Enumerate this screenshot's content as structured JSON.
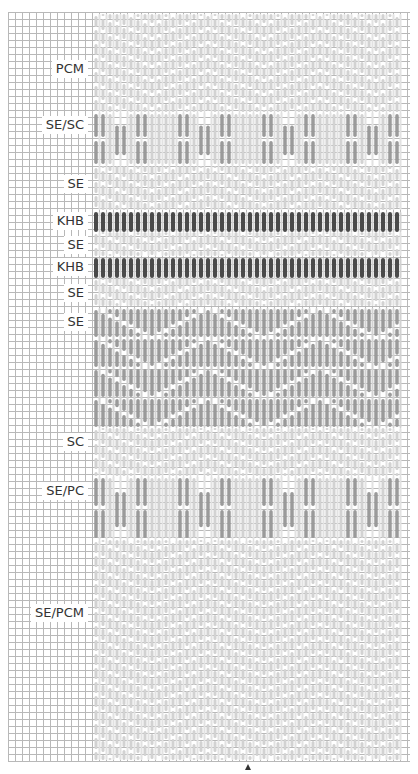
{
  "diagram": {
    "type": "bargello-stitch-chart",
    "grid": {
      "left": 8,
      "top": 12,
      "right": 410,
      "bottom": 762,
      "cell": 7,
      "color": "#b8b8b8"
    },
    "pattern_area": {
      "left": 94,
      "right": 402
    },
    "colors": {
      "light": "#d2d2d2",
      "medium": "#9a9a9a",
      "dark": "#4a4a4a",
      "gap": "#ffffff"
    },
    "sections": [
      {
        "label": "PCM",
        "label_y": 60,
        "y0": 14,
        "y1": 112,
        "style": "light-zigzag"
      },
      {
        "label": "SE/SC",
        "label_y": 116,
        "y0": 112,
        "y1": 166,
        "style": "medium-groups"
      },
      {
        "label": "SE",
        "label_y": 175,
        "y0": 166,
        "y1": 210,
        "style": "light-zigzag"
      },
      {
        "label": "KHB",
        "label_y": 212,
        "y0": 212,
        "y1": 232,
        "style": "dark-bars"
      },
      {
        "label": "SE",
        "label_y": 236,
        "y0": 232,
        "y1": 256,
        "style": "light-zigzag"
      },
      {
        "label": "KHB",
        "label_y": 258,
        "y0": 258,
        "y1": 278,
        "style": "dark-bars"
      },
      {
        "label": "SE",
        "label_y": 284,
        "y0": 278,
        "y1": 306,
        "style": "light-zigzag"
      },
      {
        "label": "SE",
        "label_y": 313,
        "y0": 308,
        "y1": 428,
        "style": "medium-diamond"
      },
      {
        "label": "SC",
        "label_y": 433,
        "y0": 428,
        "y1": 476,
        "style": "light-zigzag"
      },
      {
        "label": "SE/PC",
        "label_y": 482,
        "y0": 476,
        "y1": 540,
        "style": "medium-groups"
      },
      {
        "label": "SE/PCM",
        "label_y": 604,
        "y0": 540,
        "y1": 760,
        "style": "light-zigzag"
      }
    ],
    "marker": {
      "symbol": "triangle-up",
      "x": 248,
      "y": 764
    }
  }
}
